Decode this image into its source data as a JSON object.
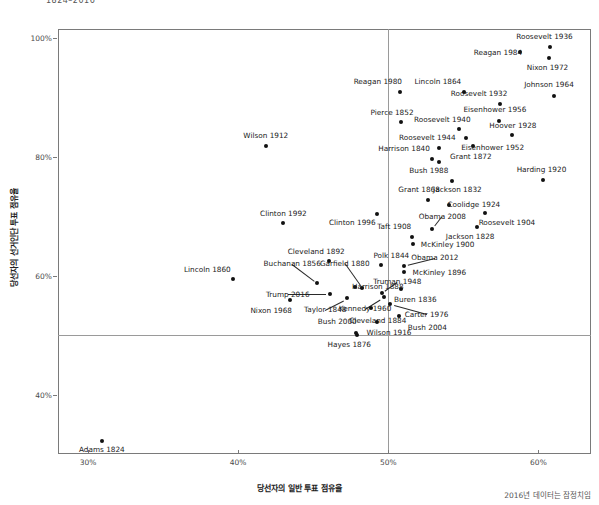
{
  "chart_data": {
    "type": "scatter",
    "title": "1824–2016",
    "xlabel": "당선자의 일반 투표 점유율",
    "ylabel": "당선자의 선거인단 투표 점유율",
    "caption": "2016년 데이터는 잠정치임",
    "xlim": [
      28.0,
      63.5
    ],
    "ylim": [
      30.0,
      101.5
    ],
    "xticks": [
      "30%",
      "40%",
      "50%",
      "60%"
    ],
    "xtick_values": [
      30,
      40,
      50,
      60
    ],
    "yticks": [
      "40%",
      "60%",
      "80%",
      "100%"
    ],
    "ytick_values": [
      40,
      60,
      80,
      100
    ],
    "grid": true,
    "legend": "none",
    "reference_lines": {
      "x": 50,
      "y": 50
    },
    "point_color": "#111111",
    "grid_color": "#d9d9d9",
    "reference_color": "#9a9a9a",
    "points": [
      {
        "label": "Adams 1824",
        "x": 30.92,
        "y": 32.2,
        "lx": 30.92,
        "ly": 30.7,
        "anchor": "c"
      },
      {
        "label": "Lincoln 1860",
        "x": 39.65,
        "y": 59.4,
        "lx": 37.95,
        "ly": 61.1,
        "anchor": "c"
      },
      {
        "label": "Wilson 1912",
        "x": 41.84,
        "y": 81.9,
        "lx": 41.84,
        "ly": 83.6,
        "anchor": "c"
      },
      {
        "label": "Clinton 1992",
        "x": 43.01,
        "y": 68.8,
        "lx": 43.01,
        "ly": 70.5,
        "anchor": "c"
      },
      {
        "label": "Nixon 1968",
        "x": 43.42,
        "y": 55.9,
        "lx": 42.2,
        "ly": 54.2,
        "anchor": "c"
      },
      {
        "label": "Buchanan 1856",
        "x": 45.28,
        "y": 58.8,
        "lx": 43.6,
        "ly": 62.0,
        "anchor": "c",
        "leader": true
      },
      {
        "label": "Trump 2016",
        "x": 46.1,
        "y": 56.9,
        "lx": 43.3,
        "ly": 56.9,
        "anchor": "c",
        "leader": true
      },
      {
        "label": "Cleveland 1892",
        "x": 46.02,
        "y": 62.4,
        "lx": 45.2,
        "ly": 64.0,
        "anchor": "c"
      },
      {
        "label": "Harrison 1888",
        "x": 47.8,
        "y": 58.1,
        "lx": 49.3,
        "ly": 58.1,
        "anchor": "c"
      },
      {
        "label": "Taylor 1848",
        "x": 47.28,
        "y": 56.2,
        "lx": 45.8,
        "ly": 54.3,
        "anchor": "c",
        "leader": true
      },
      {
        "label": "Garfield 1880",
        "x": 48.27,
        "y": 57.9,
        "lx": 47.1,
        "ly": 62.1,
        "anchor": "c",
        "leader": true
      },
      {
        "label": "Kennedy 1960",
        "x": 49.72,
        "y": 56.4,
        "lx": 48.45,
        "ly": 54.4,
        "anchor": "c",
        "leader": true
      },
      {
        "label": "Bush 2000",
        "x": 47.87,
        "y": 50.4,
        "lx": 46.6,
        "ly": 52.3,
        "anchor": "c"
      },
      {
        "label": "Hayes 1876",
        "x": 47.92,
        "y": 50.1,
        "lx": 47.4,
        "ly": 48.4,
        "anchor": "c"
      },
      {
        "label": "Cleveland 1884",
        "x": 48.85,
        "y": 54.6,
        "lx": 49.3,
        "ly": 52.5,
        "anchor": "c"
      },
      {
        "label": "Wilson 1916",
        "x": 49.24,
        "y": 52.2,
        "lx": 50.05,
        "ly": 50.4,
        "anchor": "c"
      },
      {
        "label": "Truman 1948",
        "x": 49.55,
        "y": 57.1,
        "lx": 50.6,
        "ly": 59.0,
        "anchor": "c",
        "leader": true
      },
      {
        "label": "Polk 1844",
        "x": 49.54,
        "y": 61.8,
        "lx": 50.2,
        "ly": 63.3,
        "anchor": "c"
      },
      {
        "label": "Buren 1836",
        "x": 50.83,
        "y": 57.8,
        "lx": 51.8,
        "ly": 55.9,
        "anchor": "c"
      },
      {
        "label": "Carter 1976",
        "x": 50.08,
        "y": 55.2,
        "lx": 52.55,
        "ly": 53.5,
        "anchor": "c",
        "leader": true
      },
      {
        "label": "Bush 2004",
        "x": 50.73,
        "y": 53.2,
        "lx": 52.6,
        "ly": 51.2,
        "anchor": "c"
      },
      {
        "label": "Obama 2012",
        "x": 51.06,
        "y": 61.7,
        "lx": 53.1,
        "ly": 63.0,
        "anchor": "c",
        "leader": true
      },
      {
        "label": "McKinley 1896",
        "x": 51.02,
        "y": 60.6,
        "lx": 53.4,
        "ly": 60.6,
        "anchor": "c"
      },
      {
        "label": "McKinley 1900",
        "x": 51.64,
        "y": 65.3,
        "lx": 53.95,
        "ly": 65.3,
        "anchor": "c"
      },
      {
        "label": "Taft 1908",
        "x": 51.57,
        "y": 66.5,
        "lx": 50.4,
        "ly": 68.2,
        "anchor": "c"
      },
      {
        "label": "Obama 2008",
        "x": 52.93,
        "y": 67.8,
        "lx": 53.6,
        "ly": 70.0,
        "anchor": "c",
        "leader": true
      },
      {
        "label": "Clinton 1996",
        "x": 49.23,
        "y": 70.4,
        "lx": 47.6,
        "ly": 68.9,
        "anchor": "c"
      },
      {
        "label": "Grant 1868",
        "x": 52.66,
        "y": 72.8,
        "lx": 52.05,
        "ly": 74.4,
        "anchor": "c"
      },
      {
        "label": "Coolidge 1924",
        "x": 54.04,
        "y": 71.9,
        "lx": 55.7,
        "ly": 71.9,
        "anchor": "c"
      },
      {
        "label": "Jackson 1828",
        "x": 55.93,
        "y": 68.2,
        "lx": 55.45,
        "ly": 66.5,
        "anchor": "c"
      },
      {
        "label": "Roosevelt 1904",
        "x": 56.42,
        "y": 70.6,
        "lx": 57.9,
        "ly": 68.9,
        "anchor": "c"
      },
      {
        "label": "Jackson 1832",
        "x": 54.23,
        "y": 76.0,
        "lx": 54.6,
        "ly": 74.4,
        "anchor": "c"
      },
      {
        "label": "Bush 1988",
        "x": 53.37,
        "y": 79.2,
        "lx": 52.7,
        "ly": 77.6,
        "anchor": "c"
      },
      {
        "label": "Grant 1872",
        "x": 55.63,
        "y": 81.9,
        "lx": 55.5,
        "ly": 80.1,
        "anchor": "c"
      },
      {
        "label": "Harrison 1840",
        "x": 52.88,
        "y": 79.6,
        "lx": 51.05,
        "ly": 81.4,
        "anchor": "c"
      },
      {
        "label": "Roosevelt 1944",
        "x": 53.39,
        "y": 81.4,
        "lx": 52.6,
        "ly": 83.2,
        "anchor": "c"
      },
      {
        "label": "Roosevelt 1940",
        "x": 54.74,
        "y": 84.6,
        "lx": 53.6,
        "ly": 86.2,
        "anchor": "c"
      },
      {
        "label": "Pierce 1852",
        "x": 50.83,
        "y": 85.8,
        "lx": 50.25,
        "ly": 87.5,
        "anchor": "c"
      },
      {
        "label": "Eisenhower 1952",
        "x": 55.18,
        "y": 83.2,
        "lx": 56.95,
        "ly": 81.6,
        "anchor": "c"
      },
      {
        "label": "Hoover 1928",
        "x": 58.21,
        "y": 83.6,
        "lx": 58.3,
        "ly": 85.2,
        "anchor": "c"
      },
      {
        "label": "Eisenhower 1956",
        "x": 57.37,
        "y": 86.1,
        "lx": 57.1,
        "ly": 88.0,
        "anchor": "c"
      },
      {
        "label": "Roosevelt 1932",
        "x": 57.41,
        "y": 88.9,
        "lx": 56.05,
        "ly": 90.6,
        "anchor": "c"
      },
      {
        "label": "Lincoln 1864",
        "x": 55.03,
        "y": 90.9,
        "lx": 53.3,
        "ly": 92.6,
        "anchor": "c"
      },
      {
        "label": "Reagan 1980",
        "x": 50.75,
        "y": 90.9,
        "lx": 49.3,
        "ly": 92.6,
        "anchor": "c"
      },
      {
        "label": "Reagan 1984",
        "x": 58.77,
        "y": 97.6,
        "lx": 57.3,
        "ly": 97.6,
        "anchor": "c"
      },
      {
        "label": "Johnson 1964",
        "x": 61.05,
        "y": 90.3,
        "lx": 60.7,
        "ly": 92.1,
        "anchor": "c"
      },
      {
        "label": "Nixon 1972",
        "x": 60.67,
        "y": 96.7,
        "lx": 60.6,
        "ly": 95.0,
        "anchor": "c"
      },
      {
        "label": "Roosevelt 1936",
        "x": 60.8,
        "y": 98.5,
        "lx": 60.4,
        "ly": 100.3,
        "anchor": "c"
      },
      {
        "label": "Harding 1920",
        "x": 60.32,
        "y": 76.1,
        "lx": 60.2,
        "ly": 77.9,
        "anchor": "c"
      }
    ]
  }
}
